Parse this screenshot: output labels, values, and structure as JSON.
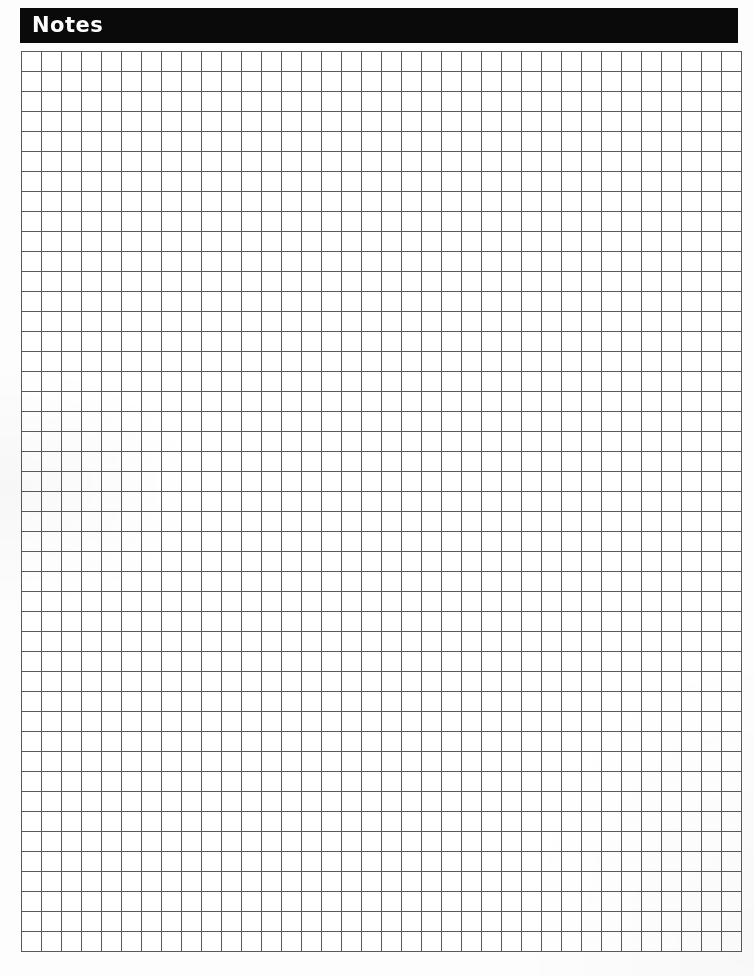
{
  "page": {
    "background_color": "#fdfdfd",
    "width": 754,
    "height": 976
  },
  "header": {
    "title": "Notes",
    "background_color": "#0a0a0a",
    "text_color": "#ffffff"
  },
  "grid": {
    "columns": 36,
    "rows": 45,
    "cell_width": 20,
    "cell_height": 20,
    "line_color": "#5a5a5a",
    "cell_background": "#ffffff",
    "content": ""
  }
}
